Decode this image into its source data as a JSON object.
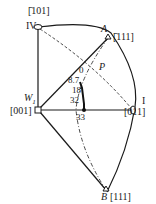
{
  "diagram": {
    "type": "stereographic-triangle",
    "poles": [
      {
        "id": "IV",
        "index": "[Ġ01]",
        "marker": "ellipse"
      },
      {
        "id": "A",
        "index": "[Ġ11]",
        "marker": "triangle"
      },
      {
        "id": "W1",
        "index": "[001]",
        "marker": "square"
      },
      {
        "id": "I",
        "index": "[011]",
        "marker": "ellipse"
      },
      {
        "id": "B",
        "index": "[111]",
        "marker": "triangle"
      }
    ],
    "labels": {
      "iv": "IV",
      "iv_index": "[̄101]",
      "a": "A",
      "a_index": "[̄111]",
      "p": "P",
      "w1": "W",
      "w1_sub": "1",
      "w1_index": "[001]",
      "i": "I",
      "i_index": "[011]",
      "b": "B",
      "b_index": "[111]"
    },
    "strain_points": [
      "0",
      "8.7",
      "18",
      "32",
      "33"
    ],
    "colors": {
      "line": "#1a1a1a",
      "background": "#ffffff"
    }
  }
}
